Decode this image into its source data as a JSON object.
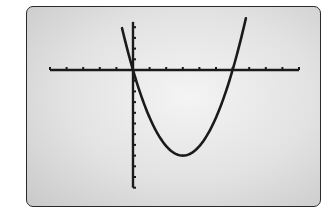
{
  "chart_data": {
    "type": "line",
    "title": "",
    "xlabel": "",
    "ylabel": "",
    "series": [
      {
        "name": "f(x)",
        "equation": "y = (8/9) x (x - 6)",
        "x": [
          -0.66,
          0,
          1,
          2,
          3,
          4,
          5,
          6,
          6.8
        ],
        "y": [
          3.9,
          0,
          -4.4,
          -7.1,
          -8,
          -7.1,
          -4.4,
          0,
          4.8
        ]
      }
    ],
    "roots": [
      0,
      6
    ],
    "vertex": [
      3,
      -8
    ],
    "xlim": [
      -5,
      10
    ],
    "ylim": [
      -11,
      4.5
    ],
    "x_tick_spacing": 1,
    "y_tick_spacing": 1,
    "grid": false,
    "legend": "none",
    "colors": {
      "curve": "#1a1a1a",
      "axes": "#1a1a1a",
      "screen_bg": "#e2e2e2",
      "frame": "#2a2a2a"
    }
  }
}
